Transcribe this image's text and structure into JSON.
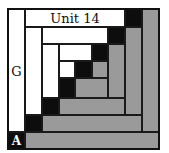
{
  "diagram": {
    "title": "Unit 14",
    "labels": {
      "left_strip": "G",
      "corner": "A"
    },
    "colors": {
      "light": "#ffffff",
      "dark": "#0d0d0d",
      "medium": "#9a9a9a",
      "outline": "#1a1a1a"
    },
    "pieces": [
      {
        "id": "g-strip",
        "color": "white",
        "x": 8,
        "y": 9,
        "w": 17,
        "h": 123
      },
      {
        "id": "a-square",
        "color": "black",
        "x": 8,
        "y": 132,
        "w": 17,
        "h": 17
      },
      {
        "id": "outer-bottom",
        "color": "gray",
        "x": 25,
        "y": 132,
        "w": 134,
        "h": 17
      },
      {
        "id": "outer-right",
        "color": "gray",
        "x": 142,
        "y": 9,
        "w": 17,
        "h": 123
      },
      {
        "id": "unit14-strip",
        "color": "white",
        "x": 25,
        "y": 9,
        "w": 100,
        "h": 18
      },
      {
        "id": "outer-corner",
        "color": "black",
        "x": 125,
        "y": 9,
        "w": 17,
        "h": 18
      },
      {
        "id": "r2-left",
        "color": "white",
        "x": 25,
        "y": 27,
        "w": 17,
        "h": 88
      },
      {
        "id": "r2-corner-bl",
        "color": "black",
        "x": 25,
        "y": 115,
        "w": 17,
        "h": 17
      },
      {
        "id": "r2-bottom",
        "color": "gray",
        "x": 42,
        "y": 115,
        "w": 100,
        "h": 17
      },
      {
        "id": "r2-right",
        "color": "gray",
        "x": 125,
        "y": 27,
        "w": 17,
        "h": 88
      },
      {
        "id": "r2-top",
        "color": "white",
        "x": 42,
        "y": 27,
        "w": 66,
        "h": 17
      },
      {
        "id": "r2-corner-tr",
        "color": "black",
        "x": 108,
        "y": 27,
        "w": 17,
        "h": 17
      },
      {
        "id": "r3-left",
        "color": "white",
        "x": 42,
        "y": 44,
        "w": 17,
        "h": 54
      },
      {
        "id": "r3-corner-bl",
        "color": "black",
        "x": 42,
        "y": 98,
        "w": 17,
        "h": 17
      },
      {
        "id": "r3-bottom",
        "color": "gray",
        "x": 59,
        "y": 98,
        "w": 66,
        "h": 17
      },
      {
        "id": "r3-right",
        "color": "gray",
        "x": 108,
        "y": 44,
        "w": 17,
        "h": 54
      },
      {
        "id": "r3-top",
        "color": "white",
        "x": 59,
        "y": 44,
        "w": 33,
        "h": 17
      },
      {
        "id": "r3-corner-tr",
        "color": "black",
        "x": 92,
        "y": 44,
        "w": 16,
        "h": 17
      },
      {
        "id": "c-white",
        "color": "white",
        "x": 59,
        "y": 61,
        "w": 16,
        "h": 17
      },
      {
        "id": "c-black-center",
        "color": "black",
        "x": 75,
        "y": 61,
        "w": 17,
        "h": 17
      },
      {
        "id": "c-gray-right",
        "color": "gray",
        "x": 92,
        "y": 61,
        "w": 16,
        "h": 17
      },
      {
        "id": "c-black-bl",
        "color": "black",
        "x": 59,
        "y": 78,
        "w": 16,
        "h": 20
      },
      {
        "id": "c-gray-bottom",
        "color": "gray",
        "x": 75,
        "y": 78,
        "w": 33,
        "h": 20
      }
    ]
  }
}
